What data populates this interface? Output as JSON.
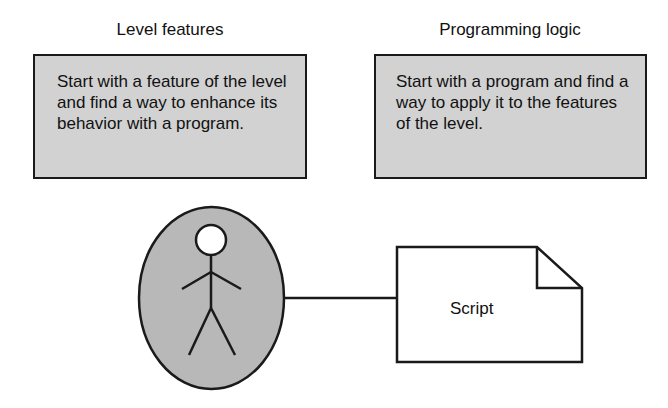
{
  "columns": [
    {
      "heading": "Level features",
      "box_text": "Start with a feature of the level and find a way to enhance its behavior with a program."
    },
    {
      "heading": "Programming logic",
      "box_text": "Start with a program and find a way to apply it to the features of the level."
    }
  ],
  "actor": {
    "icon": "stick-figure-actor"
  },
  "document": {
    "label": "Script"
  },
  "colors": {
    "box_fill": "#d2d2d2",
    "outline": "#1a1a1a",
    "actor_fill": "#b8b8b8",
    "doc_fill": "#ffffff"
  }
}
